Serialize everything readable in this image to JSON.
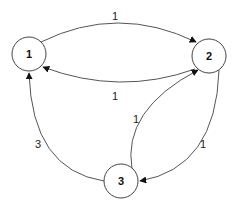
{
  "diagram": {
    "type": "directed-weighted-graph",
    "nodes": [
      {
        "id": "1",
        "label": "1",
        "cx": 29,
        "cy": 54
      },
      {
        "id": "2",
        "label": "2",
        "cx": 209,
        "cy": 56
      },
      {
        "id": "3",
        "label": "3",
        "cx": 121,
        "cy": 181
      }
    ],
    "edges": [
      {
        "from": "1",
        "to": "2",
        "weight": "1"
      },
      {
        "from": "2",
        "to": "1",
        "weight": "1"
      },
      {
        "from": "3",
        "to": "2",
        "weight": "1"
      },
      {
        "from": "2",
        "to": "3",
        "weight": "1"
      },
      {
        "from": "3",
        "to": "1",
        "weight": "3"
      }
    ],
    "colors": {
      "stroke": "#444444",
      "background": "#ffffff",
      "text": "#111111"
    }
  }
}
